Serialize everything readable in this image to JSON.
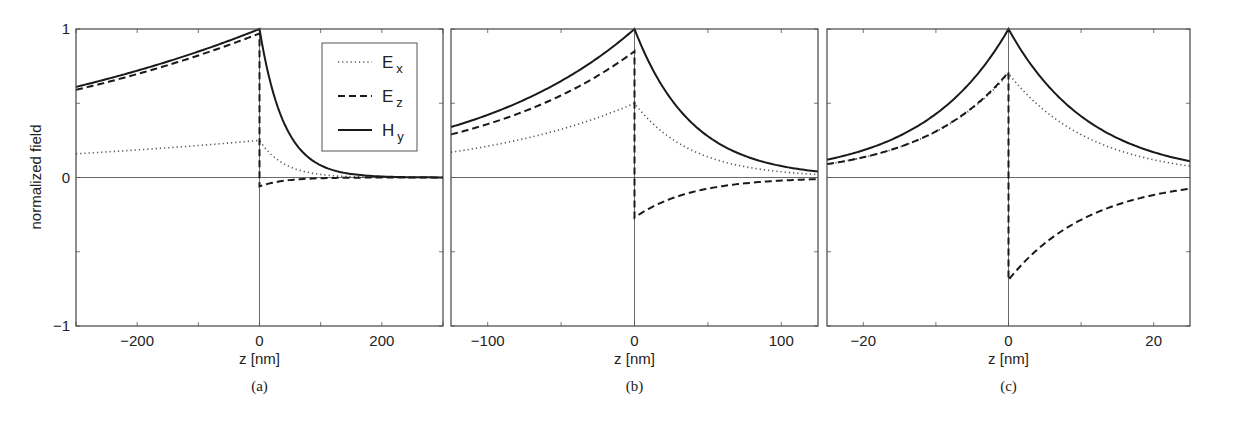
{
  "figure": {
    "ylabel": "normalized field",
    "xlabel": "z [nm]",
    "legend": [
      {
        "label": "E",
        "sub": "x",
        "style": "dotted"
      },
      {
        "label": "E",
        "sub": "z",
        "style": "dashed"
      },
      {
        "label": "H",
        "sub": "y",
        "style": "solid"
      }
    ]
  },
  "chart_data": [
    {
      "type": "line",
      "panel": "(a)",
      "xlabel": "z [nm]",
      "ylabel": "normalized field",
      "xlim": [
        -300,
        300
      ],
      "ylim": [
        -1,
        1
      ],
      "xticks": [
        -200,
        0,
        200
      ],
      "yticks": [
        -1,
        0,
        1
      ],
      "legend_position": "upper right",
      "series": [
        {
          "name": "Ex",
          "style": "dotted",
          "left": {
            "at0": 0.25,
            "atEdge": 0.16
          },
          "right": {
            "at0": 0.25,
            "decay": 40
          }
        },
        {
          "name": "Ez",
          "style": "dashed",
          "left": {
            "at0": 0.97,
            "atEdge": 0.59
          },
          "right": {
            "at0": -0.06,
            "decay": 40
          }
        },
        {
          "name": "Hy",
          "style": "solid",
          "left": {
            "at0": 1.0,
            "atEdge": 0.61
          },
          "right": {
            "at0": 1.0,
            "decay": 40
          }
        }
      ]
    },
    {
      "type": "line",
      "panel": "(b)",
      "xlabel": "z [nm]",
      "xlim": [
        -125,
        125
      ],
      "ylim": [
        -1,
        1
      ],
      "xticks": [
        -100,
        0,
        100
      ],
      "series": [
        {
          "name": "Ex",
          "style": "dotted",
          "left": {
            "at0": 0.5,
            "atEdge": 0.17
          },
          "right": {
            "at0": 0.5,
            "decay": 39
          }
        },
        {
          "name": "Ez",
          "style": "dashed",
          "left": {
            "at0": 0.85,
            "atEdge": 0.29
          },
          "right": {
            "at0": -0.27,
            "decay": 39
          }
        },
        {
          "name": "Hy",
          "style": "solid",
          "left": {
            "at0": 1.0,
            "atEdge": 0.34
          },
          "right": {
            "at0": 1.0,
            "decay": 39
          }
        }
      ]
    },
    {
      "type": "line",
      "panel": "(c)",
      "xlabel": "z [nm]",
      "xlim": [
        -25,
        25
      ],
      "ylim": [
        -1,
        1
      ],
      "xticks": [
        -20,
        0,
        20
      ],
      "series": [
        {
          "name": "Ex",
          "style": "dotted",
          "left": {
            "at0": 0.7,
            "atEdge": 0.09
          },
          "right": {
            "at0": 0.7,
            "decay": 11.3
          }
        },
        {
          "name": "Ez",
          "style": "dashed",
          "left": {
            "at0": 0.71,
            "atEdge": 0.09
          },
          "right": {
            "at0": -0.69,
            "decay": 11.3
          }
        },
        {
          "name": "Hy",
          "style": "solid",
          "left": {
            "at0": 1.0,
            "atEdge": 0.12
          },
          "right": {
            "at0": 1.0,
            "decay": 11.3
          }
        }
      ]
    }
  ]
}
